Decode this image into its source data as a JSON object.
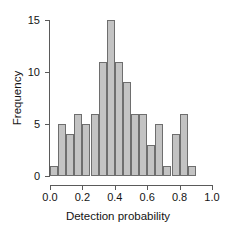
{
  "chart_data": {
    "type": "bar",
    "title": "",
    "subtitle": "",
    "xlabel": "Detection probability",
    "ylabel": "Frequency",
    "xlim": [
      0.0,
      1.0
    ],
    "ylim": [
      0,
      15
    ],
    "grid": false,
    "legend": null,
    "bin_width": 0.05,
    "bin_edges": [
      0.0,
      0.05,
      0.1,
      0.15,
      0.2,
      0.25,
      0.3,
      0.35,
      0.4,
      0.45,
      0.5,
      0.55,
      0.6,
      0.65,
      0.7,
      0.75,
      0.8,
      0.85,
      0.9
    ],
    "categories": [
      "0.00-0.05",
      "0.05-0.10",
      "0.10-0.15",
      "0.15-0.20",
      "0.20-0.25",
      "0.25-0.30",
      "0.30-0.35",
      "0.35-0.40",
      "0.40-0.45",
      "0.45-0.50",
      "0.50-0.55",
      "0.55-0.60",
      "0.60-0.65",
      "0.65-0.70",
      "0.70-0.75",
      "0.75-0.80",
      "0.80-0.85",
      "0.85-0.90"
    ],
    "values": [
      1,
      5,
      4,
      6,
      5,
      6,
      11,
      15,
      11,
      9,
      6,
      6,
      3,
      5,
      1,
      4,
      6,
      1
    ],
    "xticks": [
      "0.0",
      "0.2",
      "0.4",
      "0.6",
      "0.8",
      "1.0"
    ],
    "xtick_values": [
      0.0,
      0.2,
      0.4,
      0.6,
      0.8,
      1.0
    ],
    "yticks": [
      "0",
      "5",
      "10",
      "15"
    ],
    "ytick_values": [
      0,
      5,
      10,
      15
    ],
    "bar_fill_color": "#c3c3c3",
    "bar_edge_color": "#6e6e6e",
    "axis_color": "#5a5a5a",
    "background_color": "#ffffff"
  }
}
